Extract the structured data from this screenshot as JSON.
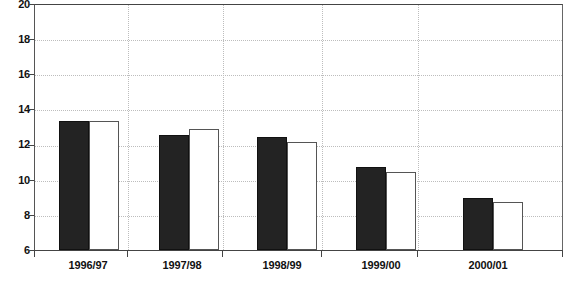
{
  "chart_data": {
    "type": "bar",
    "title": "",
    "subtitle": "",
    "xlabel": "",
    "ylabel": "",
    "ylim": [
      6,
      20
    ],
    "y_ticks": [
      6,
      8,
      10,
      12,
      14,
      16,
      18,
      20
    ],
    "y_tick_labels": [
      "6",
      "8",
      "10",
      "12",
      "14",
      "16",
      "18",
      "20"
    ],
    "grid": {
      "horizontal": true,
      "vertical": true,
      "style": "dotted"
    },
    "legend": {
      "visible": false,
      "position": "none"
    },
    "categories": [
      "1996/97",
      "1997/98",
      "1998/99",
      "1999/00",
      "2000/01"
    ],
    "series": [
      {
        "name": "series-1",
        "color": "#232323",
        "fill": "solid-black",
        "values": [
          13.4,
          12.55,
          12.45,
          10.75,
          8.95
        ]
      },
      {
        "name": "series-2",
        "color": "#ffffff",
        "fill": "white-outline",
        "values": [
          13.4,
          12.9,
          12.2,
          10.45,
          8.75
        ]
      }
    ]
  },
  "axes": {
    "y_labels": [
      "20",
      "18",
      "16",
      "14",
      "12",
      "10",
      "8",
      "6"
    ],
    "x_labels": [
      "1996/97",
      "1997/98",
      "1998/99",
      "1999/00",
      "2000/01"
    ]
  },
  "colors": {
    "bar_dark": "#232323",
    "bar_light": "#ffffff",
    "axis": "#444444",
    "grid": "#bdbdbd",
    "background": "#ffffff",
    "text": "#111111"
  }
}
